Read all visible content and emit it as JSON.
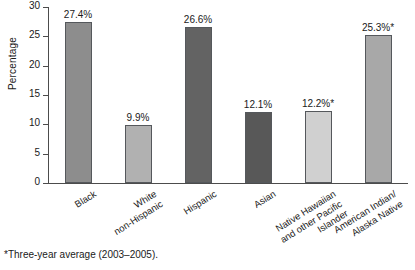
{
  "chart_data": {
    "type": "bar",
    "title": "",
    "subtitle": "",
    "xlabel": "",
    "ylabel": "Percentage",
    "ylim": [
      0,
      30
    ],
    "yticks": [
      0,
      5,
      10,
      15,
      20,
      25,
      30
    ],
    "ytick_labels": [
      "0",
      "5",
      "10",
      "15",
      "20",
      "25",
      "30"
    ],
    "grid": false,
    "legend": "none",
    "categories": [
      "Black",
      "White non-Hispanic",
      "Hispanic",
      "Asian",
      "Native Hawaiian and other Pacific Islander",
      "American Indian/ Alaska Native"
    ],
    "category_lines": [
      [
        "Black"
      ],
      [
        "White",
        "non-Hispanic"
      ],
      [
        "Hispanic"
      ],
      [
        "Asian"
      ],
      [
        "Native Hawaiian",
        "and other Pacific",
        "Islander"
      ],
      [
        "American Indian/",
        "Alaska Native"
      ]
    ],
    "values": [
      27.4,
      9.9,
      26.6,
      12.1,
      12.2,
      25.3
    ],
    "value_labels": [
      "27.4%",
      "9.9%",
      "26.6%",
      "12.1%",
      "12.2%*",
      "25.3%*"
    ],
    "bar_colors": [
      "#8d8d8d",
      "#b1b1b1",
      "#636363",
      "#585858",
      "#d0d0d0",
      "#a8a8a8"
    ],
    "annotations": [
      "*Three-year average (2003–2005)."
    ]
  },
  "figure": {
    "footnote": "*Three-year average (2003–2005).",
    "axis_color": "#4c4c4c"
  }
}
